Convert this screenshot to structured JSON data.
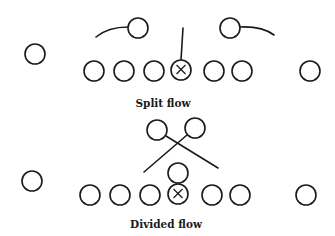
{
  "diagrams": [
    {
      "title": "Split flow",
      "label_pos": [
        163,
        107
      ],
      "players": [
        {
          "x": 35,
          "y": 54
        },
        {
          "x": 94,
          "y": 71
        },
        {
          "x": 124,
          "y": 71
        },
        {
          "x": 154,
          "y": 71
        },
        {
          "x": 181,
          "y": 70,
          "center": true
        },
        {
          "x": 214,
          "y": 71
        },
        {
          "x": 242,
          "y": 71
        },
        {
          "x": 310,
          "y": 71
        },
        {
          "x": 138,
          "y": 28
        },
        {
          "x": 230,
          "y": 28
        }
      ],
      "routes": [
        {
          "d": "M96 37 Q108 27 128 27"
        },
        {
          "d": "M240 27 Q262 26 274 35"
        },
        {
          "d": "M183 28 L181 60"
        }
      ]
    },
    {
      "title": "Divided flow",
      "label_pos": [
        166,
        228
      ],
      "players": [
        {
          "x": 32,
          "y": 181
        },
        {
          "x": 90,
          "y": 195
        },
        {
          "x": 120,
          "y": 195
        },
        {
          "x": 150,
          "y": 195
        },
        {
          "x": 178,
          "y": 194,
          "center": true
        },
        {
          "x": 212,
          "y": 195
        },
        {
          "x": 240,
          "y": 195
        },
        {
          "x": 306,
          "y": 195
        },
        {
          "x": 157,
          "y": 130
        },
        {
          "x": 195,
          "y": 128
        },
        {
          "x": 178,
          "y": 173
        }
      ],
      "routes": [
        {
          "d": "M166 136 L218 168"
        },
        {
          "d": "M187 135 L144 172"
        }
      ]
    }
  ],
  "style": {
    "radius": 10,
    "stroke": "#1a1a1a",
    "background": "#ffffff"
  }
}
